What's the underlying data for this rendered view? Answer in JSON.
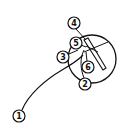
{
  "diagram": {
    "type": "hand-drawn labeled callout diagram",
    "stroke_color": "#111111",
    "background": "#ffffff",
    "main_circle": {
      "cx": 92,
      "cy": 59,
      "r": 24
    },
    "labels": [
      {
        "id": "1",
        "text": "1",
        "cx": 19,
        "cy": 116
      },
      {
        "id": "2",
        "text": "2",
        "cx": 85,
        "cy": 84
      },
      {
        "id": "3",
        "text": "3",
        "cx": 63,
        "cy": 57
      },
      {
        "id": "4",
        "text": "4",
        "cx": 74,
        "cy": 23
      },
      {
        "id": "5",
        "text": "5",
        "cx": 76,
        "cy": 43
      },
      {
        "id": "6",
        "text": "6",
        "cx": 88,
        "cy": 67
      }
    ]
  }
}
